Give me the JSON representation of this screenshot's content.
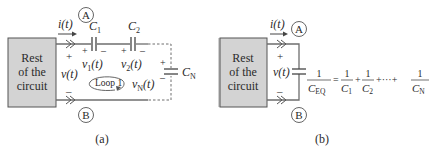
{
  "colors": {
    "box_fill": "#d3d3d3",
    "box_stroke": "#555555",
    "wire": "#6e6e6e",
    "text": "#2a2a2a"
  },
  "panel_a": {
    "box_lines": [
      "Rest",
      "of the",
      "circuit"
    ],
    "current_label": "i(t)",
    "node_top": "A",
    "node_bottom": "B",
    "voltage_label": "v(t)",
    "plus": "+",
    "minus": "–",
    "capacitors": [
      {
        "name": "C",
        "sub": "1",
        "voltage": "v",
        "vsub": "1",
        "vtail": "(t)"
      },
      {
        "name": "C",
        "sub": "2",
        "voltage": "v",
        "vsub": "2",
        "vtail": "(t)"
      },
      {
        "name": "C",
        "sub": "N",
        "voltage": "v",
        "vsub": "N",
        "vtail": "(t)"
      }
    ],
    "loop_label": "Loop 1",
    "caption": "(a)"
  },
  "panel_b": {
    "box_lines": [
      "Rest",
      "of the",
      "circuit"
    ],
    "current_label": "i(t)",
    "node_top": "A",
    "node_bottom": "B",
    "voltage_label": "v(t)",
    "plus": "+",
    "minus": "–",
    "equation": {
      "lhs_num": "1",
      "lhs_den": "C",
      "lhs_den_sub": "EQ",
      "equals": "=",
      "terms": [
        {
          "num": "1",
          "den": "C",
          "sub": "1"
        },
        {
          "num": "1",
          "den": "C",
          "sub": "2"
        },
        {
          "num": "1",
          "den": "C",
          "sub": "N"
        }
      ],
      "plus": "+",
      "ellipsis": "+···+"
    },
    "caption": "(b)"
  }
}
